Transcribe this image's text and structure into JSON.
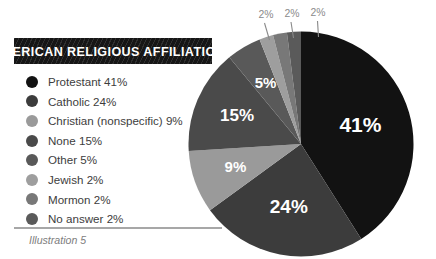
{
  "banner": {
    "title": "AMERICAN RELIGIOUS AFFILIATIONS",
    "background_color": "#161616",
    "text_color": "#ffffff"
  },
  "legend": {
    "items": [
      {
        "label": "Protestant  41%",
        "name": "Protestant",
        "percent": 41,
        "color": "#121212"
      },
      {
        "label": "Catholic  24%",
        "name": "Catholic",
        "percent": 24,
        "color": "#3c3c3c"
      },
      {
        "label": "Christian (nonspecific)  9%",
        "name": "Christian (nonspecific)",
        "percent": 9,
        "color": "#9a9a9a"
      },
      {
        "label": "None  15%",
        "name": "None",
        "percent": 15,
        "color": "#4a4a4a"
      },
      {
        "label": "Other  5%",
        "name": "Other",
        "percent": 5,
        "color": "#595959"
      },
      {
        "label": "Jewish  2%",
        "name": "Jewish",
        "percent": 2,
        "color": "#9e9e9e"
      },
      {
        "label": "Mormon  2%",
        "name": "Mormon",
        "percent": 2,
        "color": "#787878"
      },
      {
        "label": "No answer  2%",
        "name": "No answer",
        "percent": 2,
        "color": "#5a5a5a"
      }
    ]
  },
  "caption": {
    "text": "Illustration 5",
    "rule_color": "#a7a7a7",
    "text_color": "#7d7d7d"
  },
  "pie_labels": {
    "inside": [
      {
        "text": "41%",
        "font_size": 21
      },
      {
        "text": "24%",
        "font_size": 19
      },
      {
        "text": "9%",
        "font_size": 15
      },
      {
        "text": "15%",
        "font_size": 17
      },
      {
        "text": "5%",
        "font_size": 15
      }
    ],
    "callouts": [
      {
        "text": "2%"
      },
      {
        "text": "2%"
      },
      {
        "text": "2%"
      }
    ]
  },
  "chart_data": {
    "type": "pie",
    "title": "AMERICAN RELIGIOUS AFFILIATIONS",
    "subtitle": "",
    "xlabel": "",
    "ylabel": "",
    "grid": false,
    "legend_position": "left",
    "start_angle_deg": 0,
    "direction": "clockwise",
    "total": 100,
    "units": "percent",
    "categories": [
      "Protestant",
      "Catholic",
      "Christian (nonspecific)",
      "None",
      "Other",
      "Jewish",
      "Mormon",
      "No answer"
    ],
    "values": [
      41,
      24,
      9,
      15,
      5,
      2,
      2,
      2
    ],
    "data_labels": [
      "41%",
      "24%",
      "9%",
      "15%",
      "5%",
      "2%",
      "2%",
      "2%"
    ],
    "colors": [
      "#121212",
      "#3c3c3c",
      "#9a9a9a",
      "#4a4a4a",
      "#595959",
      "#9e9e9e",
      "#787878",
      "#5a5a5a"
    ],
    "slices": [
      {
        "label": "Protestant",
        "value": 41,
        "display": "41%",
        "color": "#121212",
        "label_placement": "inside"
      },
      {
        "label": "Catholic",
        "value": 24,
        "display": "24%",
        "color": "#3c3c3c",
        "label_placement": "inside"
      },
      {
        "label": "Christian (nonspecific)",
        "value": 9,
        "display": "9%",
        "color": "#9a9a9a",
        "label_placement": "inside"
      },
      {
        "label": "None",
        "value": 15,
        "display": "15%",
        "color": "#4a4a4a",
        "label_placement": "inside"
      },
      {
        "label": "Other",
        "value": 5,
        "display": "5%",
        "color": "#595959",
        "label_placement": "inside"
      },
      {
        "label": "Jewish",
        "value": 2,
        "display": "2%",
        "color": "#9e9e9e",
        "label_placement": "callout"
      },
      {
        "label": "Mormon",
        "value": 2,
        "display": "2%",
        "color": "#787878",
        "label_placement": "callout"
      },
      {
        "label": "No answer",
        "value": 2,
        "display": "2%",
        "color": "#5a5a5a",
        "label_placement": "callout"
      }
    ],
    "annotations": [
      "Illustration 5"
    ]
  }
}
